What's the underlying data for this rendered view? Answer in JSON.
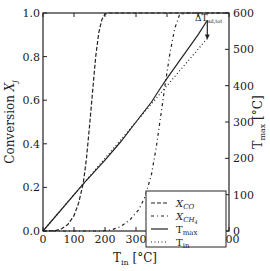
{
  "chart_data": {
    "type": "line",
    "title": "",
    "xlabel": "T_in [°C]",
    "xlabel_main": "T",
    "xlabel_sub": "in",
    "xlabel_unit": " [°C]",
    "ylabel_left": "Conversion X_j",
    "ylabel_left_main": "Conversion ",
    "ylabel_left_var": "X",
    "ylabel_left_sub": "j",
    "ylabel_right": "T_max [°C]",
    "ylabel_right_main": "T",
    "ylabel_right_sub": "max",
    "ylabel_right_unit": " [°C]",
    "xlim": [
      0,
      600
    ],
    "ylim_left": [
      0,
      1.0
    ],
    "ylim_right": [
      0,
      600
    ],
    "x_ticks": [
      "0",
      "100",
      "200",
      "300",
      "400",
      "500",
      "600"
    ],
    "x_tick_values": [
      0,
      100,
      200,
      300,
      400,
      500,
      600
    ],
    "y_left_ticks": [
      "0.0",
      "0.2",
      "0.4",
      "0.6",
      "0.8",
      "1.0"
    ],
    "y_left_tick_values": [
      0,
      0.2,
      0.4,
      0.6,
      0.8,
      1.0
    ],
    "y_right_ticks": [
      "0",
      "100",
      "200",
      "300",
      "400",
      "500",
      "600"
    ],
    "y_right_tick_values": [
      0,
      100,
      200,
      300,
      400,
      500,
      600
    ],
    "grid": false,
    "legend_position": "lower right",
    "annotation": {
      "text_main": "ΔT",
      "text_sub": "ad,tot",
      "label": "ΔT_ad,tot",
      "x": 530,
      "from_y_right": 580,
      "to_y_right": 530
    },
    "series": [
      {
        "name": "X_CO",
        "legend_main": "X",
        "legend_sub": "CO",
        "axis": "left",
        "style": "dashed",
        "x": [
          0,
          40,
          60,
          80,
          100,
          115,
          130,
          140,
          150,
          160,
          170,
          180,
          190,
          200,
          210,
          600
        ],
        "y": [
          0,
          0.002,
          0.01,
          0.03,
          0.07,
          0.13,
          0.22,
          0.33,
          0.48,
          0.64,
          0.8,
          0.91,
          0.97,
          0.995,
          1.0,
          1.0
        ]
      },
      {
        "name": "X_CH4",
        "legend_main": "X",
        "legend_sub": "CH",
        "legend_subsub": "4",
        "axis": "left",
        "style": "dashdot",
        "x": [
          0,
          190,
          220,
          250,
          280,
          310,
          330,
          350,
          365,
          380,
          395,
          410,
          425,
          440,
          460,
          600
        ],
        "y": [
          0,
          0.0,
          0.005,
          0.02,
          0.05,
          0.1,
          0.16,
          0.26,
          0.38,
          0.53,
          0.68,
          0.82,
          0.93,
          0.99,
          1.0,
          1.0
        ]
      },
      {
        "name": "T_max",
        "legend_main": "T",
        "legend_sub": "max",
        "axis": "right",
        "style": "solid",
        "x": [
          0,
          130,
          200,
          250,
          300,
          350,
          380,
          400,
          450,
          500,
          530
        ],
        "y": [
          0,
          130,
          195,
          245,
          300,
          355,
          395,
          420,
          480,
          540,
          580
        ]
      },
      {
        "name": "T_in",
        "legend_main": "T",
        "legend_sub": "in",
        "axis": "right",
        "style": "dotted",
        "x": [
          0,
          530
        ],
        "y": [
          0,
          530
        ]
      }
    ]
  }
}
